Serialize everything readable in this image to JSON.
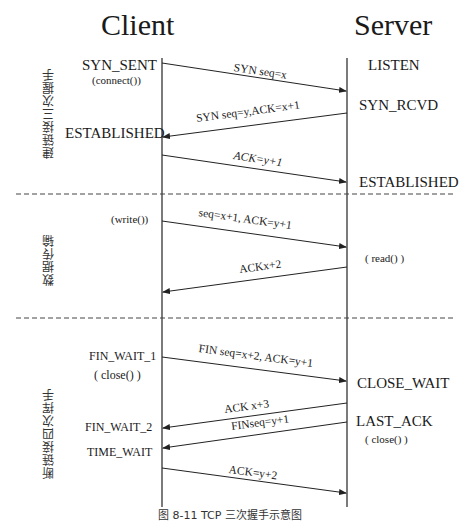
{
  "headers": {
    "client": "Client",
    "server": "Server"
  },
  "phases": [
    {
      "label": "建链接三次握手"
    },
    {
      "label": "数据传输"
    },
    {
      "label": "断链接四次挥手"
    }
  ],
  "client_states": {
    "syn_sent": "SYN_SENT",
    "connect": "(connect())",
    "established": "ESTABLISHED",
    "write": "(write())",
    "fin_wait_1": "FIN_WAIT_1",
    "close": "( close() )",
    "fin_wait_2": "FIN_WAIT_2",
    "time_wait": "TIME_WAIT"
  },
  "server_states": {
    "listen": "LISTEN",
    "syn_rcvd": "SYN_RCVD",
    "established": "ESTABLISHED",
    "read": "( read() )",
    "close_wait": "CLOSE_WAIT",
    "last_ack": "LAST_ACK",
    "close": "( close() )"
  },
  "messages": [
    {
      "label": "SYN seq=x",
      "direction": "client-to-server"
    },
    {
      "label": "SYN seq=y,ACK=x+1",
      "direction": "server-to-client"
    },
    {
      "label": "ACK=y+1",
      "direction": "client-to-server"
    },
    {
      "label": "seq=x+1, ACK=y+1",
      "direction": "client-to-server"
    },
    {
      "label": "ACKx+2",
      "direction": "server-to-client"
    },
    {
      "label": "FIN seq=x+2, ACK=y+1",
      "direction": "client-to-server"
    },
    {
      "label": "ACK x+3",
      "direction": "server-to-client"
    },
    {
      "label": "FINseq=y+1",
      "direction": "server-to-client"
    },
    {
      "label": "ACK=y+2",
      "direction": "client-to-server"
    }
  ],
  "caption": "图 8-11    TCP 三次握手示意图"
}
